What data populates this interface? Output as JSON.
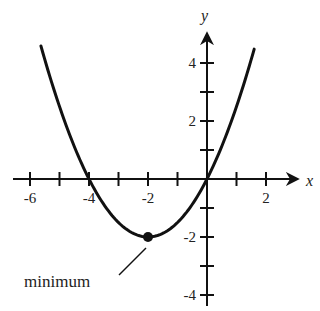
{
  "chart_data": {
    "type": "line",
    "title": "",
    "xlabel": "x",
    "ylabel": "y",
    "xlim": [
      -6.6,
      3.1
    ],
    "ylim": [
      -4.5,
      4.8
    ],
    "grid": false,
    "x_ticks": [
      -6,
      -5,
      -4,
      -3,
      -2,
      -1,
      1,
      2
    ],
    "x_tick_labels": [
      {
        "value": -6,
        "label": "-6"
      },
      {
        "value": -4,
        "label": "-4"
      },
      {
        "value": -2,
        "label": "-2"
      },
      {
        "value": 2,
        "label": "2"
      }
    ],
    "y_ticks": [
      -4,
      -3,
      -2,
      -1,
      1,
      2,
      3,
      4
    ],
    "y_tick_labels": [
      {
        "value": 4,
        "label": "4"
      },
      {
        "value": 2,
        "label": "2"
      },
      {
        "value": -2,
        "label": "-2"
      },
      {
        "value": -4,
        "label": "-4"
      }
    ],
    "series": [
      {
        "name": "parabola",
        "equation": "y = 0.5(x + 2)^2 - 2",
        "x_range": [
          -5.63,
          1.6
        ],
        "color": "#111111"
      }
    ],
    "points": [
      {
        "name": "minimum",
        "x": -2,
        "y": -2
      }
    ],
    "annotations": [
      {
        "text": "minimum",
        "target": {
          "x": -2,
          "y": -2
        }
      }
    ]
  }
}
